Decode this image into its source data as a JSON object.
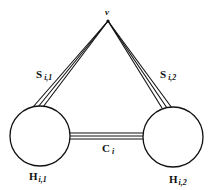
{
  "diagram": {
    "apex": {
      "label": "v"
    },
    "left_bundle": {
      "label": "S",
      "subscript": "i,1"
    },
    "right_bundle": {
      "label": "S",
      "subscript": "i,2"
    },
    "connector": {
      "label": "C",
      "subscript": "i"
    },
    "left_node": {
      "label": "H",
      "subscript": "i,1"
    },
    "right_node": {
      "label": "H",
      "subscript": "i,2"
    },
    "colors": {
      "stroke": "#111111",
      "background": "#ffffff"
    }
  }
}
